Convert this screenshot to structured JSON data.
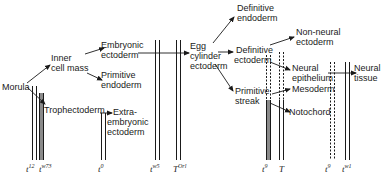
{
  "diagram": {
    "type": "cell-lineage-tree",
    "nodes": [
      {
        "id": "morula",
        "label": "Morula"
      },
      {
        "id": "inner_cell_mass",
        "label_lines": [
          "Inner",
          "cell mass"
        ]
      },
      {
        "id": "trophectoderm",
        "label": "Trophectoderm"
      },
      {
        "id": "embryonic_ectoderm",
        "label_lines": [
          "Embryonic",
          "ectoderm"
        ]
      },
      {
        "id": "primitive_endoderm",
        "label_lines": [
          "Primitive",
          "endoderm"
        ]
      },
      {
        "id": "extraembryonic_ectoderm",
        "label_lines": [
          "Extra-",
          "embryonic",
          "ectoderm"
        ]
      },
      {
        "id": "egg_cylinder_ectoderm",
        "label_lines": [
          "Egg",
          "cylinder",
          "ectoderm"
        ]
      },
      {
        "id": "definitive_endoderm",
        "label_lines": [
          "Definitive",
          "endoderm"
        ]
      },
      {
        "id": "definitive_ectoderm",
        "label_lines": [
          "Definitive",
          "ectoderm"
        ]
      },
      {
        "id": "primitive_streak",
        "label_lines": [
          "Primitive",
          "streak"
        ]
      },
      {
        "id": "non_neural_ectoderm",
        "label_lines": [
          "Non-neural",
          "ectoderm"
        ]
      },
      {
        "id": "neural_epithelium",
        "label_lines": [
          "Neural",
          "epithelium"
        ]
      },
      {
        "id": "mesoderm",
        "label": "Mesoderm"
      },
      {
        "id": "notochord",
        "label": "Notochord"
      },
      {
        "id": "neural_tissue",
        "label_lines": [
          "Neural",
          "tissue"
        ]
      }
    ],
    "edges": [
      [
        "morula",
        "inner_cell_mass"
      ],
      [
        "morula",
        "trophectoderm"
      ],
      [
        "inner_cell_mass",
        "embryonic_ectoderm"
      ],
      [
        "inner_cell_mass",
        "primitive_endoderm"
      ],
      [
        "trophectoderm",
        "extraembryonic_ectoderm"
      ],
      [
        "embryonic_ectoderm",
        "egg_cylinder_ectoderm"
      ],
      [
        "egg_cylinder_ectoderm",
        "definitive_endoderm"
      ],
      [
        "egg_cylinder_ectoderm",
        "definitive_ectoderm"
      ],
      [
        "egg_cylinder_ectoderm",
        "primitive_streak"
      ],
      [
        "definitive_ectoderm",
        "non_neural_ectoderm"
      ],
      [
        "definitive_ectoderm",
        "neural_epithelium"
      ],
      [
        "primitive_streak",
        "mesoderm"
      ],
      [
        "primitive_streak",
        "notochord"
      ],
      [
        "neural_epithelium",
        "neural_tissue"
      ]
    ],
    "mutation_blocks": [
      {
        "base": "t",
        "sup": "12",
        "style": "solid"
      },
      {
        "base": "t",
        "sup": "w73",
        "style": "shaded"
      },
      {
        "base": "t",
        "sup": "0",
        "style": "solid"
      },
      {
        "base": "t",
        "sup": "w5",
        "style": "solid"
      },
      {
        "base": "T",
        "sup": "Orl",
        "style": "solid"
      },
      {
        "base": "t",
        "sup": "9",
        "style": "dashed-then-shaded"
      },
      {
        "base": "T",
        "sup": "",
        "style": "dashed-then-solid"
      },
      {
        "base": "t",
        "sup": "9",
        "style": "dashed"
      },
      {
        "base": "t",
        "sup": "w1",
        "style": "solid"
      }
    ]
  },
  "labels": {
    "morula": "Morula",
    "icm_1": "Inner",
    "icm_2": "cell mass",
    "troph": "Trophectoderm",
    "embecto_1": "Embryonic",
    "embecto_2": "ectoderm",
    "primendo_1": "Primitive",
    "primendo_2": "endoderm",
    "extra_1": "Extra-",
    "extra_2": "embryonic",
    "extra_3": "ectoderm",
    "egg_1": "Egg",
    "egg_2": "cylinder",
    "egg_3": "ectoderm",
    "defendo_1": "Definitive",
    "defendo_2": "endoderm",
    "defecto_1": "Definitive",
    "defecto_2": "ectoderm",
    "primstreak_1": "Primitive",
    "primstreak_2": "streak",
    "nonneural_1": "Non-neural",
    "nonneural_2": "ectoderm",
    "neuralepi_1": "Neural",
    "neuralepi_2": "epithelium",
    "mesoderm": "Mesoderm",
    "notochord": "Notochord",
    "neuraltissue_1": "Neural",
    "neuraltissue_2": "tissue"
  },
  "genes": [
    {
      "base": "t",
      "sup": "12"
    },
    {
      "base": "t",
      "sup": "w73"
    },
    {
      "base": "t",
      "sup": "0"
    },
    {
      "base": "t",
      "sup": "w5"
    },
    {
      "base": "T",
      "sup": "Orl"
    },
    {
      "base": "t",
      "sup": "9"
    },
    {
      "base": "T",
      "sup": ""
    },
    {
      "base": "t",
      "sup": "9"
    },
    {
      "base": "t",
      "sup": "w1"
    }
  ],
  "colors": {
    "ink": "#1a1a1a",
    "shade": "#8a8a8a",
    "background": "#ffffff"
  }
}
